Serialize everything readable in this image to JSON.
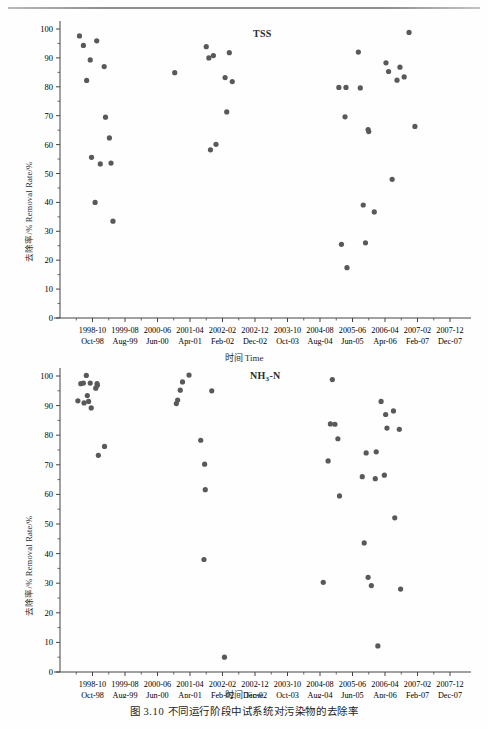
{
  "page": {
    "header_ghost_text": "",
    "caption": "图 3.10  不同运行阶段中试系统对污染物的去除率"
  },
  "axis_common": {
    "ylabel": "去除率/% Removal Rate/%",
    "xlabel": "时间 Time",
    "y_ticks": [
      0,
      10,
      20,
      30,
      40,
      50,
      60,
      70,
      80,
      90,
      100
    ],
    "x_tick_top": [
      "1998-10",
      "1999-08",
      "2000-06",
      "2001-04",
      "2002-02",
      "2002-12",
      "2003-10",
      "2004-08",
      "2005-06",
      "2006-04",
      "2007-02",
      "2007-12"
    ],
    "x_tick_bottom": [
      "Oct-98",
      "Aug-99",
      "Jun-00",
      "Apr-01",
      "Feb-02",
      "Dec-02",
      "Oct-03",
      "Aug-04",
      "Jun-05",
      "Apr-06",
      "Feb-07",
      "Dec-07"
    ]
  },
  "chart_data": [
    {
      "type": "scatter",
      "id": "tss",
      "title": "TSS",
      "title_html": "TSS",
      "xlabel": "时间 Time",
      "ylabel": "去除率/% Removal Rate/%",
      "ylim": [
        0,
        100
      ],
      "ytick_step": 10,
      "grid": false,
      "legend": "none",
      "xtick_labels_primary": [
        "1998-10",
        "1999-08",
        "2000-06",
        "2001-04",
        "2002-02",
        "2002-12",
        "2003-10",
        "2004-08",
        "2005-06",
        "2006-04",
        "2007-02",
        "2007-12"
      ],
      "xtick_labels_secondary": [
        "Oct-98",
        "Aug-99",
        "Jun-00",
        "Apr-01",
        "Feb-02",
        "Dec-02",
        "Oct-03",
        "Aug-04",
        "Jun-05",
        "Apr-06",
        "Feb-07",
        "Dec-07"
      ],
      "x_is_time_index": true,
      "x_index_range": [
        0,
        12.4
      ],
      "points": [
        {
          "x": 0.6,
          "y": 97.6
        },
        {
          "x": 0.72,
          "y": 94.3
        },
        {
          "x": 0.82,
          "y": 82.2
        },
        {
          "x": 0.93,
          "y": 89.3
        },
        {
          "x": 0.97,
          "y": 55.6
        },
        {
          "x": 1.08,
          "y": 40.0
        },
        {
          "x": 1.13,
          "y": 95.9
        },
        {
          "x": 1.24,
          "y": 53.3
        },
        {
          "x": 1.36,
          "y": 87.0
        },
        {
          "x": 1.4,
          "y": 69.5
        },
        {
          "x": 1.52,
          "y": 62.3
        },
        {
          "x": 1.57,
          "y": 53.6
        },
        {
          "x": 1.63,
          "y": 33.5
        },
        {
          "x": 3.53,
          "y": 84.9
        },
        {
          "x": 4.5,
          "y": 93.9
        },
        {
          "x": 4.58,
          "y": 90.0
        },
        {
          "x": 4.63,
          "y": 58.2
        },
        {
          "x": 4.72,
          "y": 90.8
        },
        {
          "x": 4.8,
          "y": 60.1
        },
        {
          "x": 5.08,
          "y": 83.2
        },
        {
          "x": 5.13,
          "y": 71.3
        },
        {
          "x": 5.21,
          "y": 91.8
        },
        {
          "x": 5.3,
          "y": 81.8
        },
        {
          "x": 8.58,
          "y": 79.8
        },
        {
          "x": 8.66,
          "y": 25.5
        },
        {
          "x": 8.77,
          "y": 69.6
        },
        {
          "x": 8.8,
          "y": 79.8
        },
        {
          "x": 8.83,
          "y": 17.4
        },
        {
          "x": 9.18,
          "y": 92.0
        },
        {
          "x": 9.24,
          "y": 79.6
        },
        {
          "x": 9.33,
          "y": 39.1
        },
        {
          "x": 9.4,
          "y": 26.0
        },
        {
          "x": 9.48,
          "y": 65.2
        },
        {
          "x": 9.5,
          "y": 64.5
        },
        {
          "x": 9.67,
          "y": 36.7
        },
        {
          "x": 10.03,
          "y": 88.3
        },
        {
          "x": 10.11,
          "y": 85.3
        },
        {
          "x": 10.22,
          "y": 48.0
        },
        {
          "x": 10.37,
          "y": 82.3
        },
        {
          "x": 10.46,
          "y": 86.8
        },
        {
          "x": 10.59,
          "y": 83.4
        },
        {
          "x": 10.74,
          "y": 98.8
        },
        {
          "x": 10.92,
          "y": 66.3
        }
      ]
    },
    {
      "type": "scatter",
      "id": "nh3n",
      "title": "NH3-N",
      "title_html": "NH<sub>3</sub>-N",
      "xlabel": "时间 Time",
      "ylabel": "去除率/% Removal Rate/%",
      "ylim": [
        0,
        100
      ],
      "ytick_step": 10,
      "grid": false,
      "legend": "none",
      "xtick_labels_primary": [
        "1998-10",
        "1999-08",
        "2000-06",
        "2001-04",
        "2002-02",
        "2002-12",
        "2003-10",
        "2004-08",
        "2005-06",
        "2006-04",
        "2007-02",
        "2007-12"
      ],
      "xtick_labels_secondary": [
        "Oct-98",
        "Aug-99",
        "Jun-00",
        "Apr-01",
        "Feb-02",
        "Dec-02",
        "Oct-03",
        "Aug-04",
        "Jun-05",
        "Apr-06",
        "Feb-07",
        "Dec-07"
      ],
      "x_is_time_index": true,
      "x_index_range": [
        0,
        12.4
      ],
      "points": [
        {
          "x": 0.55,
          "y": 91.6
        },
        {
          "x": 0.64,
          "y": 97.4
        },
        {
          "x": 0.72,
          "y": 97.6
        },
        {
          "x": 0.74,
          "y": 90.9
        },
        {
          "x": 0.81,
          "y": 100.2
        },
        {
          "x": 0.84,
          "y": 93.4
        },
        {
          "x": 0.88,
          "y": 91.4
        },
        {
          "x": 0.93,
          "y": 97.6
        },
        {
          "x": 0.96,
          "y": 89.2
        },
        {
          "x": 1.1,
          "y": 95.9
        },
        {
          "x": 1.14,
          "y": 97.4
        },
        {
          "x": 1.15,
          "y": 96.9
        },
        {
          "x": 1.18,
          "y": 73.2
        },
        {
          "x": 1.37,
          "y": 76.2
        },
        {
          "x": 3.58,
          "y": 90.7
        },
        {
          "x": 3.62,
          "y": 91.9
        },
        {
          "x": 3.7,
          "y": 95.2
        },
        {
          "x": 3.77,
          "y": 98.0
        },
        {
          "x": 3.97,
          "y": 100.3
        },
        {
          "x": 4.33,
          "y": 78.3
        },
        {
          "x": 4.45,
          "y": 70.2
        },
        {
          "x": 4.47,
          "y": 61.6
        },
        {
          "x": 4.43,
          "y": 38.0
        },
        {
          "x": 4.67,
          "y": 95.0
        },
        {
          "x": 5.06,
          "y": 5.0
        },
        {
          "x": 8.1,
          "y": 30.3
        },
        {
          "x": 8.25,
          "y": 71.3
        },
        {
          "x": 8.32,
          "y": 83.8
        },
        {
          "x": 8.38,
          "y": 98.8
        },
        {
          "x": 8.46,
          "y": 83.7
        },
        {
          "x": 8.55,
          "y": 78.8
        },
        {
          "x": 8.6,
          "y": 59.5
        },
        {
          "x": 9.3,
          "y": 66.0
        },
        {
          "x": 9.36,
          "y": 43.6
        },
        {
          "x": 9.42,
          "y": 74.0
        },
        {
          "x": 9.48,
          "y": 32.0
        },
        {
          "x": 9.58,
          "y": 29.2
        },
        {
          "x": 9.7,
          "y": 65.3
        },
        {
          "x": 9.73,
          "y": 74.4
        },
        {
          "x": 9.78,
          "y": 8.8
        },
        {
          "x": 9.88,
          "y": 91.4
        },
        {
          "x": 9.98,
          "y": 66.5
        },
        {
          "x": 10.02,
          "y": 87.0
        },
        {
          "x": 10.06,
          "y": 82.4
        },
        {
          "x": 10.26,
          "y": 88.2
        },
        {
          "x": 10.3,
          "y": 52.1
        },
        {
          "x": 10.44,
          "y": 82.0
        },
        {
          "x": 10.48,
          "y": 28.0
        }
      ]
    }
  ],
  "colors": {
    "marker": "#595959",
    "axis": "#444444",
    "text": "#2b2b2b",
    "rule": "#8f8f8f"
  }
}
